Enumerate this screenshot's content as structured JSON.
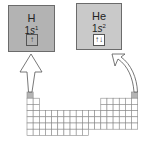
{
  "diagram": {
    "hydrogen": {
      "symbol": "H",
      "config_prefix": "1",
      "config_orbital": "s",
      "config_superscript": "1",
      "orbital_arrows": "↑",
      "box_color": "#b3b3b3",
      "orbital_fill": "#b3b3b3"
    },
    "helium": {
      "symbol": "He",
      "config_prefix": "1",
      "config_orbital": "s",
      "config_superscript": "2",
      "orbital_arrows": "↑↓",
      "box_color": "#c9c9c9",
      "orbital_fill": "#ffffff"
    },
    "periodic_table": {
      "columns": 18,
      "rows": 7,
      "highlighted_cells": [
        "H",
        "He"
      ],
      "highlight_color": "#b5b5b5",
      "grid_color": "#8a8a8a"
    },
    "arrows": [
      {
        "from": "H",
        "to": "hydrogen-box",
        "style": "straight-hollow"
      },
      {
        "from": "He",
        "to": "helium-box",
        "style": "curved-hollow"
      }
    ]
  }
}
